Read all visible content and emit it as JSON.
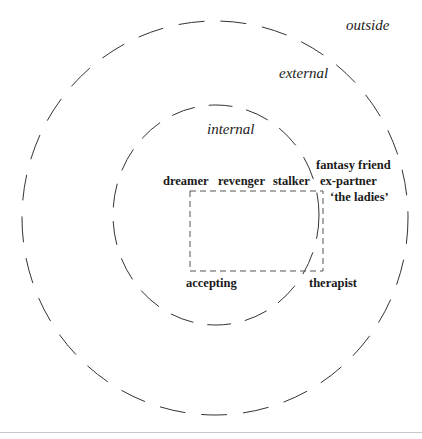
{
  "diagram": {
    "zones": {
      "outside": "outside",
      "external": "external",
      "internal": "internal"
    },
    "roles": {
      "dreamer": "dreamer",
      "revenger": "revenger",
      "stalker": "stalker",
      "fantasy_friend": "fantasy friend",
      "ex_partner": "ex-partner",
      "the_ladies": "‘the ladies’",
      "accepting": "accepting",
      "therapist": "therapist"
    },
    "colors": {
      "stroke": "#333333",
      "text": "#1a1a1a",
      "background": "#ffffff",
      "rule": "#c8c8c8"
    }
  }
}
